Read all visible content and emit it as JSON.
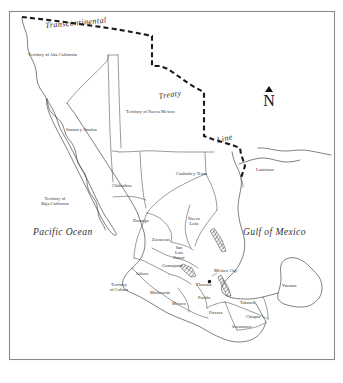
{
  "map": {
    "title": "Mexico in 1824 with the Transcontinental Treaty Line",
    "frame": {
      "x": 9,
      "y": 11,
      "width": 326,
      "height": 349
    },
    "colors": {
      "background": "#ffffff",
      "frame_stroke": "#8a8a8a",
      "coastline": "#3b3b3b",
      "interior_border": "#4a4a4a",
      "treaty_line": "#1a1a1a",
      "label_text": "#2a2a2a"
    },
    "oceans": [
      {
        "name": "pacific-ocean",
        "label": "Pacific Ocean",
        "x": 33,
        "y": 232
      },
      {
        "name": "gulf-of-mexico",
        "label": "Gulf of Mexico",
        "x": 243,
        "y": 232
      }
    ],
    "boundary_labels": [
      {
        "name": "transcontinental",
        "label": "Transcontinental",
        "x": 45,
        "y": 23,
        "rotate": -5
      },
      {
        "name": "treaty",
        "label": "Treaty",
        "x": 158,
        "y": 94,
        "rotate": -8
      },
      {
        "name": "line",
        "label": "Line",
        "x": 217,
        "y": 139,
        "rotate": -12
      }
    ],
    "north_arrow": {
      "name": "north-arrow",
      "letter": "N",
      "x": 262,
      "y": 88
    },
    "cities": [
      {
        "name": "mexico-city",
        "label": "México City",
        "x": 218,
        "y": 272,
        "dot_x": 209.5,
        "dot_y": 281.5
      }
    ],
    "territories": [
      {
        "name": "territory-of-alta-california",
        "label": "Territory of Alta California",
        "x": 28,
        "y": 56,
        "lines": [
          "Territory of Alta California"
        ]
      },
      {
        "name": "territory-of-nuevo-mexico",
        "label": "Territory of Nuevo México",
        "x": 129,
        "y": 113,
        "lines": [
          "Territory of Nuevo México"
        ]
      },
      {
        "name": "sonora-y-sinaloa",
        "label": "Sonora y Sinaloa",
        "x": 71,
        "y": 131,
        "lines": [
          "Sonora y Sinaloa"
        ]
      },
      {
        "name": "territory-of-baja-california",
        "label": "Territory of Baja California",
        "x": 41,
        "y": 200,
        "lines": [
          "Territory of",
          "Baja California"
        ]
      },
      {
        "name": "chihuahua",
        "label": "Chihuahua",
        "x": 117,
        "y": 187,
        "lines": [
          "Chihuahua"
        ]
      },
      {
        "name": "coahuila-y-texas",
        "label": "Coahuila y Texas",
        "x": 185,
        "y": 174,
        "lines": [
          "Coahuila y Texas"
        ]
      },
      {
        "name": "louisiana",
        "label": "Louisiana",
        "x": 259,
        "y": 171,
        "lines": [
          "Louisiana"
        ]
      },
      {
        "name": "durango",
        "label": "Durango",
        "x": 136,
        "y": 222,
        "lines": [
          "Durango"
        ]
      },
      {
        "name": "zacatecas",
        "label": "Zacatecas",
        "x": 157,
        "y": 240,
        "lines": [
          "Zacatecas"
        ]
      },
      {
        "name": "nuevo-leon",
        "label": "Nuevo León",
        "x": 189,
        "y": 222,
        "lines": [
          "Nuevo",
          "León"
        ]
      },
      {
        "name": "san-luis-potosi",
        "label": "San Luis Potosí",
        "x": 175,
        "y": 252,
        "lines": [
          "San",
          "Luis",
          "Potosí"
        ]
      },
      {
        "name": "guanajuato",
        "label": "Guanajuato",
        "x": 167,
        "y": 266,
        "lines": [
          "Guanajuato"
        ]
      },
      {
        "name": "jalisco",
        "label": "Jalisco",
        "x": 139,
        "y": 274,
        "lines": [
          "Jalisco"
        ]
      },
      {
        "name": "territory-of-colima",
        "label": "Territory of Colima",
        "x": 113,
        "y": 286,
        "lines": [
          "Territory",
          "of Colima"
        ]
      },
      {
        "name": "michoacan",
        "label": "Michoacán",
        "x": 155,
        "y": 293,
        "lines": [
          "Michoacán"
        ]
      },
      {
        "name": "mexico",
        "label": "México",
        "x": 175,
        "y": 304,
        "lines": [
          "México"
        ]
      },
      {
        "name": "tlaxcala",
        "label": "Tlaxcala",
        "x": 200,
        "y": 285,
        "lines": [
          "Tlaxcala"
        ]
      },
      {
        "name": "puebla",
        "label": "Puebla",
        "x": 202,
        "y": 298,
        "lines": [
          "Puebla"
        ]
      },
      {
        "name": "oaxaca",
        "label": "Oaxaca",
        "x": 213,
        "y": 313,
        "lines": [
          "Oaxaca"
        ]
      },
      {
        "name": "tabasco",
        "label": "Tabasco",
        "x": 243,
        "y": 303,
        "lines": [
          "Tabasco"
        ]
      },
      {
        "name": "chiapas",
        "label": "Chiapas",
        "x": 249,
        "y": 317,
        "lines": [
          "Chiapas"
        ]
      },
      {
        "name": "soconusco",
        "label": "Soconusco",
        "x": 236,
        "y": 327,
        "lines": [
          "Soconusco"
        ]
      },
      {
        "name": "yucatan",
        "label": "Yucatan",
        "x": 285,
        "y": 286,
        "lines": [
          "Yucatan"
        ]
      }
    ]
  }
}
